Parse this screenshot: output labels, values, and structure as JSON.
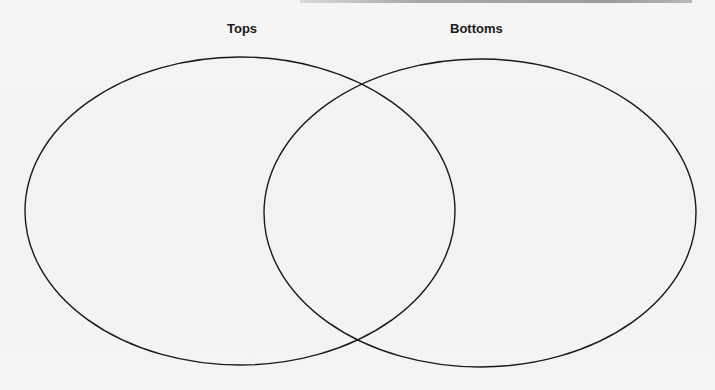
{
  "diagram": {
    "type": "venn",
    "sets": [
      {
        "label": "Tops",
        "shape": "ellipse",
        "cx": 240,
        "cy": 211,
        "rx": 215,
        "ry": 154
      },
      {
        "label": "Bottoms",
        "shape": "ellipse",
        "cx": 480,
        "cy": 213,
        "rx": 216,
        "ry": 154
      }
    ],
    "overlap_label": "",
    "stroke_color": "#1a1a1a",
    "stroke_width": 1.4,
    "background_color": "#f4f4f3",
    "top_bar_color": "#9c9c9c"
  }
}
